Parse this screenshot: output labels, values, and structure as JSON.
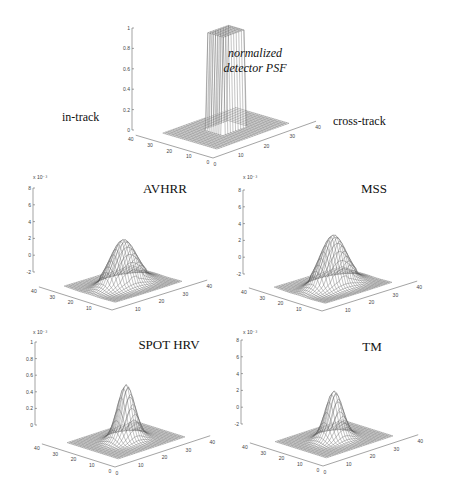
{
  "figure": {
    "top_panel": {
      "title_line1": "normalized",
      "title_line2": "detector PSF",
      "left_label": "in-track",
      "right_label": "cross-track"
    },
    "panels": [
      {
        "title": "AVHRR",
        "zscale": "x 10⁻³"
      },
      {
        "title": "MSS",
        "zscale": "x 10⁻³"
      },
      {
        "title": "SPOT HRV",
        "zscale": "x 10⁻³"
      },
      {
        "title": "TM",
        "zscale": "x 10⁻³"
      }
    ]
  },
  "chart_data": [
    {
      "type": "surface",
      "title": "normalized detector PSF",
      "xlabel": "cross-track",
      "ylabel": "in-track",
      "x_ticks": [
        "0",
        "10",
        "20",
        "30",
        "40"
      ],
      "y_ticks": [
        "0",
        "10",
        "20",
        "30",
        "40"
      ],
      "z_ticks": [
        "0",
        "0.2",
        "0.4",
        "0.6",
        "0.8",
        "1"
      ],
      "zlim": [
        0,
        1
      ],
      "shape": "rect",
      "peak": 1.0
    },
    {
      "type": "surface",
      "title": "AVHRR",
      "x_ticks": [
        "10",
        "20",
        "30",
        "40"
      ],
      "y_ticks": [
        "10",
        "20",
        "30",
        "40"
      ],
      "z_ticks": [
        "-2",
        "0",
        "2",
        "4",
        "6",
        "8"
      ],
      "zscale": "x 10^-3",
      "zlim": [
        -2,
        8
      ],
      "shape": "broad",
      "peak": 5.5
    },
    {
      "type": "surface",
      "title": "MSS",
      "x_ticks": [
        "10",
        "20",
        "30",
        "40"
      ],
      "y_ticks": [
        "10",
        "20",
        "30",
        "40"
      ],
      "z_ticks": [
        "-2",
        "0",
        "2",
        "4",
        "6",
        "8"
      ],
      "zscale": "x 10^-3",
      "zlim": [
        -2,
        8
      ],
      "shape": "broad",
      "peak": 6.2
    },
    {
      "type": "surface",
      "title": "SPOT HRV",
      "x_ticks": [
        "0",
        "10",
        "20",
        "30",
        "40"
      ],
      "y_ticks": [
        "0",
        "10",
        "20",
        "30",
        "40"
      ],
      "z_ticks": [
        "0",
        "0.2",
        "0.4",
        "0.6",
        "0.8",
        "1"
      ],
      "zscale": "x 10^-3",
      "zlim": [
        0,
        1
      ],
      "shape": "gauss",
      "peak": 0.7
    },
    {
      "type": "surface",
      "title": "TM",
      "x_ticks": [
        "0",
        "10",
        "20",
        "30",
        "40"
      ],
      "y_ticks": [
        "0",
        "10",
        "20",
        "30",
        "40"
      ],
      "z_ticks": [
        "-2",
        "0",
        "2",
        "4",
        "6",
        "8"
      ],
      "zscale": "x 10^-3",
      "zlim": [
        -2,
        8
      ],
      "shape": "gauss",
      "peak": 6.0
    }
  ]
}
